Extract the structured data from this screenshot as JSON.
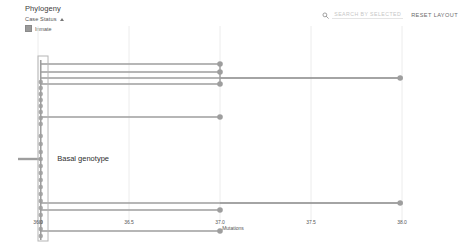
{
  "header": {
    "title": "Phylogeny",
    "legend": {
      "group_label": "Case Status",
      "caret_icon": "chevron-up-icon",
      "items": [
        {
          "label": "Inmate",
          "color": "#9a9a9a"
        }
      ]
    },
    "search": {
      "icon": "search-icon",
      "placeholder": "SEARCH BY SELECTED"
    },
    "reset_label": "RESET LAYOUT"
  },
  "chart_data": {
    "type": "scatter",
    "title": "Phylogeny",
    "xlabel": "Mutations",
    "ylabel": "",
    "xlim": [
      36.0,
      38.0
    ],
    "grid": true,
    "legend_position": "top-left",
    "tick_labels": [
      "36.0",
      "36.5",
      "37.0",
      "37.5",
      "38.0"
    ],
    "tick_values": [
      36.0,
      36.5,
      37.0,
      37.5,
      38.0
    ],
    "annotations": [
      {
        "text": "Basal genotype",
        "x": 36.04,
        "y": 133
      }
    ],
    "series": [
      {
        "name": "Inmate",
        "color": "#9e9e9e",
        "points": [
          {
            "x": 36.015,
            "y": 56
          },
          {
            "x": 36.015,
            "y": 62
          },
          {
            "x": 36.015,
            "y": 68
          },
          {
            "x": 36.015,
            "y": 74
          },
          {
            "x": 36.015,
            "y": 80
          },
          {
            "x": 36.015,
            "y": 86
          },
          {
            "x": 36.015,
            "y": 92
          },
          {
            "x": 36.015,
            "y": 98
          },
          {
            "x": 36.015,
            "y": 110
          },
          {
            "x": 36.015,
            "y": 118
          },
          {
            "x": 36.015,
            "y": 126
          },
          {
            "x": 36.015,
            "y": 133
          },
          {
            "x": 36.015,
            "y": 140
          },
          {
            "x": 36.015,
            "y": 147
          },
          {
            "x": 36.015,
            "y": 154
          },
          {
            "x": 36.015,
            "y": 161
          },
          {
            "x": 36.015,
            "y": 168
          },
          {
            "x": 36.015,
            "y": 175
          },
          {
            "x": 36.015,
            "y": 182
          },
          {
            "x": 36.015,
            "y": 189
          },
          {
            "x": 36.015,
            "y": 196
          },
          {
            "x": 36.015,
            "y": 203
          },
          {
            "x": 36.015,
            "y": 210
          },
          {
            "x": 37.0,
            "y": 38
          },
          {
            "x": 37.0,
            "y": 46
          },
          {
            "x": 37.0,
            "y": 58
          },
          {
            "x": 37.0,
            "y": 91
          },
          {
            "x": 37.0,
            "y": 184
          },
          {
            "x": 37.0,
            "y": 205
          },
          {
            "x": 37.99,
            "y": 52
          },
          {
            "x": 37.99,
            "y": 177
          }
        ]
      }
    ],
    "selection_box": {
      "x0": 36.0,
      "x1": 36.055,
      "y0": 58,
      "y1": 215
    }
  }
}
